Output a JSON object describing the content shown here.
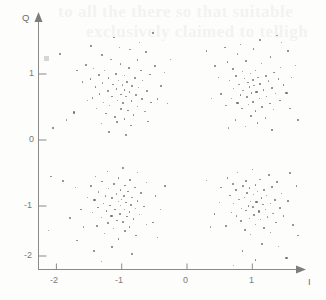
{
  "figure": {
    "background_color": "#fdfdfc",
    "point_color": "#6e6e6e",
    "axis_color": "#8a8a8a",
    "bleed_text_line1": "to all the   there so that suitable",
    "bleed_text_line2": "exclusively claimed to telligh"
  },
  "axes": {
    "x_name": "I",
    "y_name": "Q",
    "x_ticks": [
      "-2",
      "-1",
      "0",
      "1"
    ],
    "y_ticks": [
      "1",
      "0",
      "-1",
      "-2"
    ]
  },
  "chart_data": {
    "type": "scatter",
    "title": "",
    "xlabel": "I",
    "ylabel": "Q",
    "xlim": [
      -2.45,
      1.75
    ],
    "ylim": [
      -2.45,
      1.72
    ],
    "xticks": [
      -2,
      -1,
      0,
      1
    ],
    "yticks": [
      1,
      0,
      -1,
      -2
    ],
    "grid": false,
    "legend": "none",
    "clusters": [
      {
        "name": "symbol-01",
        "center": [
          -1.0,
          0.95
        ],
        "sigma": 0.23,
        "n": 125
      },
      {
        "name": "symbol-11",
        "center": [
          1.0,
          0.95
        ],
        "sigma": 0.23,
        "n": 125
      },
      {
        "name": "symbol-00",
        "center": [
          -1.0,
          -0.95
        ],
        "sigma": 0.23,
        "n": 125
      },
      {
        "name": "symbol-10",
        "center": [
          1.0,
          -0.95
        ],
        "sigma": 0.23,
        "n": 125
      }
    ],
    "points": [
      [
        -1.03,
        1.4
      ],
      [
        -1.3,
        1.29
      ],
      [
        -0.87,
        1.37
      ],
      [
        -1.55,
        1.14
      ],
      [
        -0.63,
        1.33
      ],
      [
        -1.16,
        1.22
      ],
      [
        -0.76,
        1.21
      ],
      [
        -1.43,
        1.08
      ],
      [
        -0.5,
        1.13
      ],
      [
        -1.02,
        1.15
      ],
      [
        -1.26,
        1.05
      ],
      [
        -0.89,
        1.09
      ],
      [
        -0.7,
        1.05
      ],
      [
        -1.35,
        0.99
      ],
      [
        -1.09,
        1.0
      ],
      [
        -0.95,
        0.98
      ],
      [
        -0.57,
        0.99
      ],
      [
        -1.2,
        0.94
      ],
      [
        -0.8,
        0.95
      ],
      [
        -1.48,
        0.92
      ],
      [
        -1.05,
        0.9
      ],
      [
        -0.92,
        0.88
      ],
      [
        -0.68,
        0.9
      ],
      [
        -1.29,
        0.86
      ],
      [
        -1.13,
        0.84
      ],
      [
        -0.99,
        0.83
      ],
      [
        -0.84,
        0.82
      ],
      [
        -1.4,
        0.8
      ],
      [
        -0.74,
        0.79
      ],
      [
        -1.08,
        0.77
      ],
      [
        -0.96,
        0.76
      ],
      [
        -1.22,
        0.75
      ],
      [
        -0.88,
        0.73
      ],
      [
        -0.61,
        0.74
      ],
      [
        -1.34,
        0.7
      ],
      [
        -1.01,
        0.69
      ],
      [
        -0.79,
        0.68
      ],
      [
        -1.15,
        0.66
      ],
      [
        -0.93,
        0.65
      ],
      [
        -1.45,
        0.64
      ],
      [
        -0.69,
        0.62
      ],
      [
        -1.06,
        0.6
      ],
      [
        -0.85,
        0.59
      ],
      [
        -1.27,
        0.57
      ],
      [
        -0.98,
        0.56
      ],
      [
        -0.55,
        0.57
      ],
      [
        -1.18,
        0.52
      ],
      [
        -0.76,
        0.51
      ],
      [
        -1.38,
        0.48
      ],
      [
        -1.02,
        0.47
      ],
      [
        -0.9,
        0.45
      ],
      [
        -0.64,
        0.43
      ],
      [
        -1.24,
        0.4
      ],
      [
        -0.82,
        0.38
      ],
      [
        -1.1,
        0.35
      ],
      [
        -0.96,
        0.32
      ],
      [
        -1.52,
        0.6
      ],
      [
        -1.6,
        0.88
      ],
      [
        -1.68,
        1.05
      ],
      [
        -1.73,
        0.42
      ],
      [
        -0.4,
        0.82
      ],
      [
        -0.34,
        1.02
      ],
      [
        -0.45,
        0.62
      ],
      [
        -0.3,
        0.55
      ],
      [
        -1.84,
        0.3
      ],
      [
        -2.05,
        0.18
      ],
      [
        -0.25,
        1.22
      ],
      [
        -1.95,
        1.3
      ],
      [
        -1.12,
        1.55
      ],
      [
        -0.72,
        1.48
      ],
      [
        -1.47,
        1.42
      ],
      [
        -0.52,
        1.62
      ],
      [
        -1.07,
        0.27
      ],
      [
        -0.86,
        0.22
      ],
      [
        -1.31,
        0.25
      ],
      [
        -0.6,
        0.28
      ],
      [
        -1.19,
        0.12
      ],
      [
        -0.94,
        0.08
      ],
      [
        1.02,
        1.38
      ],
      [
        0.78,
        1.3
      ],
      [
        1.28,
        1.26
      ],
      [
        0.62,
        1.18
      ],
      [
        1.15,
        1.16
      ],
      [
        0.9,
        1.2
      ],
      [
        1.44,
        1.1
      ],
      [
        0.7,
        1.08
      ],
      [
        1.05,
        1.05
      ],
      [
        0.85,
        1.03
      ],
      [
        1.33,
        1.02
      ],
      [
        0.97,
        1.0
      ],
      [
        1.2,
        0.98
      ],
      [
        0.75,
        0.97
      ],
      [
        1.09,
        0.95
      ],
      [
        0.88,
        0.93
      ],
      [
        1.4,
        0.92
      ],
      [
        1.0,
        0.91
      ],
      [
        0.65,
        0.9
      ],
      [
        1.25,
        0.89
      ],
      [
        0.93,
        0.87
      ],
      [
        1.12,
        0.85
      ],
      [
        0.8,
        0.84
      ],
      [
        1.48,
        0.83
      ],
      [
        1.03,
        0.82
      ],
      [
        0.96,
        0.8
      ],
      [
        1.3,
        0.79
      ],
      [
        0.72,
        0.78
      ],
      [
        1.17,
        0.76
      ],
      [
        0.86,
        0.75
      ],
      [
        1.06,
        0.73
      ],
      [
        0.99,
        0.71
      ],
      [
        1.36,
        0.7
      ],
      [
        0.82,
        0.68
      ],
      [
        1.22,
        0.66
      ],
      [
        0.91,
        0.65
      ],
      [
        1.11,
        0.63
      ],
      [
        0.68,
        0.62
      ],
      [
        1.42,
        0.6
      ],
      [
        1.01,
        0.58
      ],
      [
        0.77,
        0.57
      ],
      [
        1.27,
        0.55
      ],
      [
        0.94,
        0.53
      ],
      [
        1.15,
        0.5
      ],
      [
        0.84,
        0.48
      ],
      [
        1.33,
        0.46
      ],
      [
        1.05,
        0.44
      ],
      [
        0.6,
        0.52
      ],
      [
        1.52,
        0.72
      ],
      [
        1.6,
        0.95
      ],
      [
        1.66,
        1.12
      ],
      [
        1.58,
        0.48
      ],
      [
        0.48,
        0.95
      ],
      [
        0.42,
        1.12
      ],
      [
        0.52,
        0.7
      ],
      [
        0.38,
        0.62
      ],
      [
        1.7,
        0.3
      ],
      [
        0.3,
        1.35
      ],
      [
        1.12,
        1.52
      ],
      [
        0.82,
        1.45
      ],
      [
        1.38,
        1.58
      ],
      [
        0.58,
        1.4
      ],
      [
        1.55,
        1.35
      ],
      [
        1.45,
        1.48
      ],
      [
        0.98,
        0.36
      ],
      [
        1.2,
        0.33
      ],
      [
        0.74,
        0.3
      ],
      [
        1.08,
        0.26
      ],
      [
        0.9,
        0.2
      ],
      [
        1.3,
        0.15
      ],
      [
        0.64,
        0.18
      ],
      [
        -0.98,
        -0.42
      ],
      [
        -1.22,
        -0.48
      ],
      [
        -0.75,
        -0.5
      ],
      [
        -1.4,
        -0.55
      ],
      [
        -1.05,
        -0.58
      ],
      [
        -0.88,
        -0.6
      ],
      [
        -1.3,
        -0.63
      ],
      [
        -0.62,
        -0.65
      ],
      [
        -1.12,
        -0.67
      ],
      [
        -0.95,
        -0.69
      ],
      [
        -1.48,
        -0.7
      ],
      [
        -0.8,
        -0.72
      ],
      [
        -1.2,
        -0.74
      ],
      [
        -1.02,
        -0.76
      ],
      [
        -0.9,
        -0.78
      ],
      [
        -1.35,
        -0.79
      ],
      [
        -0.7,
        -0.8
      ],
      [
        -1.08,
        -0.82
      ],
      [
        -0.97,
        -0.84
      ],
      [
        -1.25,
        -0.85
      ],
      [
        -0.84,
        -0.87
      ],
      [
        -1.15,
        -0.88
      ],
      [
        -1.0,
        -0.9
      ],
      [
        -1.42,
        -0.91
      ],
      [
        -0.76,
        -0.92
      ],
      [
        -1.05,
        -0.94
      ],
      [
        -0.93,
        -0.95
      ],
      [
        -1.28,
        -0.96
      ],
      [
        -0.86,
        -0.98
      ],
      [
        -1.18,
        -0.99
      ],
      [
        -1.01,
        -1.0
      ],
      [
        -0.66,
        -1.01
      ],
      [
        -1.36,
        -1.02
      ],
      [
        -0.79,
        -1.04
      ],
      [
        -1.1,
        -1.05
      ],
      [
        -0.96,
        -1.06
      ],
      [
        -1.23,
        -1.08
      ],
      [
        -0.88,
        -1.09
      ],
      [
        -1.45,
        -1.1
      ],
      [
        -1.03,
        -1.12
      ],
      [
        -0.72,
        -1.13
      ],
      [
        -1.16,
        -1.15
      ],
      [
        -0.92,
        -1.16
      ],
      [
        -1.31,
        -1.18
      ],
      [
        -0.82,
        -1.2
      ],
      [
        -1.07,
        -1.22
      ],
      [
        -0.99,
        -1.24
      ],
      [
        -1.21,
        -1.26
      ],
      [
        -0.62,
        -1.28
      ],
      [
        -1.38,
        -1.3
      ],
      [
        -0.88,
        -1.32
      ],
      [
        -1.12,
        -1.35
      ],
      [
        -0.95,
        -1.38
      ],
      [
        -1.26,
        -1.42
      ],
      [
        -0.78,
        -1.45
      ],
      [
        -1.05,
        -1.5
      ],
      [
        -1.52,
        -0.88
      ],
      [
        -1.62,
        -1.05
      ],
      [
        -1.7,
        -0.72
      ],
      [
        -1.8,
        -1.18
      ],
      [
        -0.48,
        -0.85
      ],
      [
        -0.4,
        -1.05
      ],
      [
        -0.52,
        -1.25
      ],
      [
        -0.34,
        -0.7
      ],
      [
        -1.9,
        -0.62
      ],
      [
        -2.08,
        -0.55
      ],
      [
        -1.58,
        -1.32
      ],
      [
        -0.45,
        -1.48
      ],
      [
        -1.15,
        -1.62
      ],
      [
        -0.85,
        -1.72
      ],
      [
        -1.42,
        -1.68
      ],
      [
        -1.3,
        -1.85
      ],
      [
        -0.98,
        -1.95
      ],
      [
        -1.68,
        -1.52
      ],
      [
        -2.12,
        -1.38
      ],
      [
        1.0,
        -0.45
      ],
      [
        0.78,
        -0.5
      ],
      [
        1.25,
        -0.52
      ],
      [
        0.62,
        -0.58
      ],
      [
        1.12,
        -0.6
      ],
      [
        0.9,
        -0.62
      ],
      [
        1.38,
        -0.64
      ],
      [
        0.7,
        -0.66
      ],
      [
        1.05,
        -0.68
      ],
      [
        0.86,
        -0.7
      ],
      [
        1.3,
        -0.71
      ],
      [
        0.96,
        -0.73
      ],
      [
        1.18,
        -0.75
      ],
      [
        0.75,
        -0.76
      ],
      [
        1.08,
        -0.78
      ],
      [
        0.92,
        -0.8
      ],
      [
        1.45,
        -0.81
      ],
      [
        1.02,
        -0.83
      ],
      [
        0.66,
        -0.84
      ],
      [
        1.22,
        -0.85
      ],
      [
        0.88,
        -0.87
      ],
      [
        1.14,
        -0.88
      ],
      [
        0.8,
        -0.9
      ],
      [
        1.35,
        -0.91
      ],
      [
        0.98,
        -0.93
      ],
      [
        1.06,
        -0.94
      ],
      [
        1.28,
        -0.96
      ],
      [
        0.72,
        -0.97
      ],
      [
        1.16,
        -0.98
      ],
      [
        0.94,
        -1.0
      ],
      [
        1.01,
        -1.01
      ],
      [
        1.42,
        -1.03
      ],
      [
        0.84,
        -1.04
      ],
      [
        1.2,
        -1.05
      ],
      [
        0.9,
        -1.07
      ],
      [
        1.1,
        -1.08
      ],
      [
        0.68,
        -1.1
      ],
      [
        1.32,
        -1.12
      ],
      [
        1.03,
        -1.14
      ],
      [
        0.76,
        -1.15
      ],
      [
        1.24,
        -1.17
      ],
      [
        0.96,
        -1.19
      ],
      [
        1.13,
        -1.21
      ],
      [
        0.82,
        -1.23
      ],
      [
        1.36,
        -1.25
      ],
      [
        1.05,
        -1.28
      ],
      [
        0.6,
        -1.3
      ],
      [
        1.18,
        -1.33
      ],
      [
        0.88,
        -1.36
      ],
      [
        1.28,
        -1.4
      ],
      [
        0.98,
        -1.44
      ],
      [
        1.48,
        -1.15
      ],
      [
        1.55,
        -0.92
      ],
      [
        1.62,
        -1.28
      ],
      [
        1.68,
        -0.7
      ],
      [
        0.5,
        -0.95
      ],
      [
        0.42,
        -1.12
      ],
      [
        0.52,
        -0.72
      ],
      [
        0.36,
        -1.32
      ],
      [
        1.58,
        -0.5
      ],
      [
        0.3,
        -0.62
      ],
      [
        1.15,
        -1.58
      ],
      [
        0.85,
        -1.68
      ],
      [
        1.4,
        -1.62
      ],
      [
        1.05,
        -1.82
      ],
      [
        0.72,
        -1.9
      ],
      [
        1.52,
        -1.78
      ],
      [
        1.7,
        -1.45
      ],
      [
        0.62,
        -2.05
      ]
    ]
  }
}
